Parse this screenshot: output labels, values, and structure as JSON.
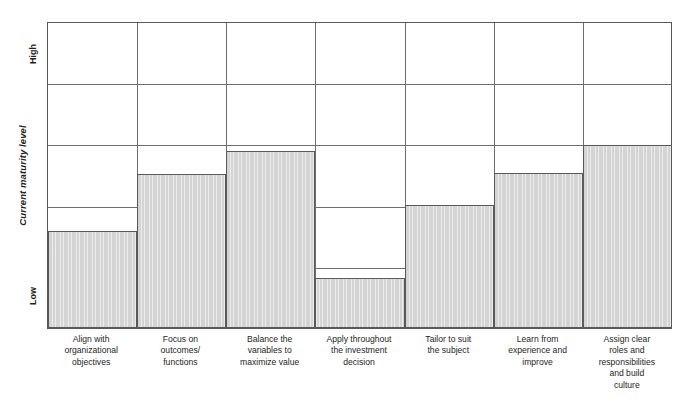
{
  "chart_data": {
    "type": "bar",
    "title": "",
    "xlabel": "",
    "ylabel": "Current maturity level",
    "ytick_labels": [
      "Low",
      "High"
    ],
    "ylim": [
      0,
      5
    ],
    "grid": true,
    "gridlines_horizontal": 4,
    "legend": "none",
    "bar_fill_color": "#d4d4d4",
    "bar_border_color": "#58595b",
    "grid_color": "#6d6e71",
    "categories": [
      "Align with organizational objectives",
      "Focus on outcomes/ functions",
      "Balance the variables to maximize value",
      "Apply throughout the investment decision",
      "Tailor to suit the subject",
      "Learn from experience and improve",
      "Assign clear roles and responsibilities and build culture"
    ],
    "category_lines": [
      [
        "Align with",
        "organizational",
        "objectives"
      ],
      [
        "Focus on",
        "outcomes/",
        "functions"
      ],
      [
        "Balance the",
        "variables to",
        "maximize value"
      ],
      [
        "Apply throughout",
        "the investment",
        "decision"
      ],
      [
        "Tailor to suit",
        "the subject"
      ],
      [
        "Learn from",
        "experience and",
        "improve"
      ],
      [
        "Assign clear",
        "roles and",
        "responsibilities",
        "and build",
        "culture"
      ]
    ],
    "values": [
      1.58,
      2.5,
      2.88,
      0.81,
      2.0,
      2.51,
      2.98
    ]
  }
}
